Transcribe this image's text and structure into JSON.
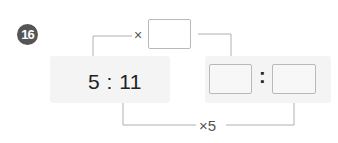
{
  "problem": {
    "number": "16",
    "given_ratio": {
      "left": "5",
      "right": "11",
      "text": "5 : 11"
    },
    "top_operation": {
      "symbol": "×",
      "blank_value": ""
    },
    "bottom_operation": {
      "label": "×5"
    },
    "answer_ratio": {
      "first_blank": "",
      "separator": ":",
      "second_blank": ""
    }
  },
  "colors": {
    "badge": "#555555",
    "panel": "#f4f4f4",
    "line": "#a8a8a8",
    "box_border": "#b9b9b9",
    "text": "#222222"
  }
}
